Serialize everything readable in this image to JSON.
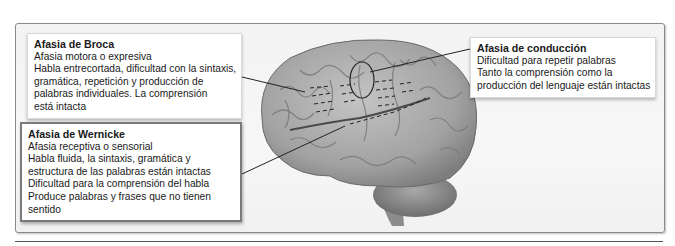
{
  "figure": {
    "image_subject": "lateral view of human brain (left hemisphere)",
    "colors": {
      "frame_border": "#8a8a8a",
      "frame_bg": "#f4f4f4",
      "brain": "#a9a9a9",
      "leader_line": "#222222"
    }
  },
  "callouts": {
    "broca": {
      "title": "Afasia de Broca",
      "lines": [
        "Afasia motora o expresiva",
        "Habla entrecortada, dificultad con la sintaxis,",
        "gramática, repetición y producción de",
        "palabras individuales. La comprensión",
        "está intacta"
      ]
    },
    "wernicke": {
      "title": "Afasia de Wernicke",
      "lines": [
        "Afasia receptiva o sensorial",
        "Habla fluida, la sintaxis, gramática y",
        "estructura de las palabras están intactas",
        "Dificultad para la comprensión del habla",
        "Produce palabras y frases que no tienen",
        "sentido"
      ]
    },
    "conduction": {
      "title": "Afasia de conducción",
      "lines": [
        "Dificultad para repetir palabras",
        "Tanto la comprensión como la",
        "producción del lenguaje están intactas"
      ]
    }
  }
}
